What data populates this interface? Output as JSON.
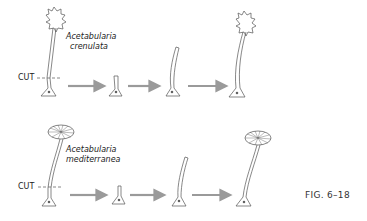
{
  "figure": {
    "caption": "FIG. 6–18",
    "rows": [
      {
        "species_line1": "Acetabularia",
        "species_line2": "crenulata",
        "cut_label": "CUT",
        "cap_type": "crenulate",
        "stages": [
          "whole cell with crenulate cap",
          "cut base with nucleus",
          "regrowing stalk",
          "stalk elongates",
          "regenerated crenulate cap"
        ]
      },
      {
        "species_line1": "Acetabularia",
        "species_line2": "mediterranea",
        "cut_label": "CUT",
        "cap_type": "umbrella",
        "stages": [
          "whole cell with umbrella cap",
          "cut base with nucleus",
          "regrowing stalk",
          "stalk elongates",
          "regenerated umbrella cap"
        ]
      }
    ],
    "colors": {
      "line": "#555555",
      "arrow": "#9a9a9a",
      "text": "#222222"
    }
  }
}
